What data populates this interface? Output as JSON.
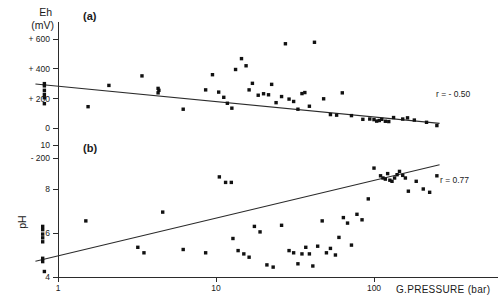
{
  "figure": {
    "background_color": "#ffffff",
    "ink_color": "#1a1a1a",
    "point_color": "#111111"
  },
  "xaxis": {
    "title": "G.PRESSURE (bar)",
    "scale": "log",
    "ticks": [
      "1",
      "10",
      "100"
    ],
    "tick_values": [
      1,
      10,
      100
    ],
    "range": [
      0.7,
      300
    ]
  },
  "panel_a": {
    "label": "(a)",
    "ylabel_line1": "Eh",
    "ylabel_line2": "(mV)",
    "correlation": "r = - 0.50",
    "ticks": [
      "+ 600",
      "+ 400",
      "+ 200",
      "0",
      "- 200"
    ],
    "tick_values": [
      600,
      400,
      200,
      0,
      -200
    ]
  },
  "panel_b": {
    "label": "(b)",
    "ylabel": "pH",
    "correlation": "r = 0.77",
    "ticks": [
      "10",
      "8",
      "6",
      "4"
    ],
    "tick_values": [
      10,
      8,
      6,
      4
    ]
  },
  "chart_data": [
    {
      "type": "scatter",
      "id": "panel-a",
      "title": "(a)",
      "xlabel": "G.PRESSURE (bar)",
      "ylabel": "Eh (mV)",
      "xscale": "log",
      "xlim": [
        0.7,
        300
      ],
      "ylim": [
        -300,
        700
      ],
      "xticks": [
        1,
        10,
        100
      ],
      "yticks": [
        600,
        400,
        200,
        0,
        -200
      ],
      "grid": false,
      "annotation": "r = - 0.50",
      "correlation_r": -0.5,
      "trendline": {
        "x": [
          0.72,
          260
        ],
        "y": [
          297,
          33
        ]
      },
      "points": [
        {
          "x": 0.82,
          "y": 300
        },
        {
          "x": 0.82,
          "y": 285
        },
        {
          "x": 0.82,
          "y": 255
        },
        {
          "x": 0.82,
          "y": 228
        },
        {
          "x": 0.82,
          "y": 205
        },
        {
          "x": 0.82,
          "y": 165
        },
        {
          "x": 1.55,
          "y": 145
        },
        {
          "x": 2.1,
          "y": 288
        },
        {
          "x": 3.4,
          "y": 352
        },
        {
          "x": 4.3,
          "y": 268
        },
        {
          "x": 4.35,
          "y": 255
        },
        {
          "x": 4.3,
          "y": 238
        },
        {
          "x": 6.2,
          "y": 128
        },
        {
          "x": 8.6,
          "y": 258
        },
        {
          "x": 9.5,
          "y": 360
        },
        {
          "x": 10.4,
          "y": 243
        },
        {
          "x": 11.2,
          "y": 208
        },
        {
          "x": 11.8,
          "y": 168
        },
        {
          "x": 12.6,
          "y": 135
        },
        {
          "x": 13.3,
          "y": 395
        },
        {
          "x": 14.5,
          "y": 468
        },
        {
          "x": 15.5,
          "y": 420
        },
        {
          "x": 16.2,
          "y": 258
        },
        {
          "x": 17.0,
          "y": 302
        },
        {
          "x": 18.5,
          "y": 222
        },
        {
          "x": 20.0,
          "y": 232
        },
        {
          "x": 21.5,
          "y": 225
        },
        {
          "x": 22.5,
          "y": 295
        },
        {
          "x": 24.0,
          "y": 172
        },
        {
          "x": 26.0,
          "y": 213
        },
        {
          "x": 27.5,
          "y": 568
        },
        {
          "x": 29.0,
          "y": 196
        },
        {
          "x": 31.0,
          "y": 180
        },
        {
          "x": 33.0,
          "y": 128
        },
        {
          "x": 35.0,
          "y": 233
        },
        {
          "x": 36.5,
          "y": 240
        },
        {
          "x": 39.0,
          "y": 148
        },
        {
          "x": 42.0,
          "y": 578
        },
        {
          "x": 48.0,
          "y": 198
        },
        {
          "x": 53.0,
          "y": 92
        },
        {
          "x": 58.0,
          "y": 88
        },
        {
          "x": 63.0,
          "y": 238
        },
        {
          "x": 72.0,
          "y": 85
        },
        {
          "x": 85.0,
          "y": 60
        },
        {
          "x": 94.0,
          "y": 62
        },
        {
          "x": 100.0,
          "y": 58
        },
        {
          "x": 104.0,
          "y": 48
        },
        {
          "x": 108.0,
          "y": 52
        },
        {
          "x": 112.0,
          "y": 60
        },
        {
          "x": 118.0,
          "y": 47
        },
        {
          "x": 124.0,
          "y": 45
        },
        {
          "x": 133.0,
          "y": 72
        },
        {
          "x": 152.0,
          "y": 62
        },
        {
          "x": 163.0,
          "y": 70
        },
        {
          "x": 180.0,
          "y": 55
        },
        {
          "x": 215.0,
          "y": 40
        },
        {
          "x": 250.0,
          "y": 18
        }
      ]
    },
    {
      "type": "scatter",
      "id": "panel-b",
      "title": "(b)",
      "xlabel": "G.PRESSURE (bar)",
      "ylabel": "pH",
      "xscale": "log",
      "xlim": [
        0.7,
        300
      ],
      "ylim": [
        4,
        10.4
      ],
      "xticks": [
        1,
        10,
        100
      ],
      "yticks": [
        10,
        8,
        6,
        4
      ],
      "grid": false,
      "annotation": "r = 0.77",
      "correlation_r": 0.77,
      "trendline": {
        "x": [
          0.72,
          260
        ],
        "y": [
          4.72,
          9.1
        ]
      },
      "points": [
        {
          "x": 0.8,
          "y": 6.3
        },
        {
          "x": 0.8,
          "y": 6.15
        },
        {
          "x": 0.8,
          "y": 5.95
        },
        {
          "x": 0.8,
          "y": 5.78
        },
        {
          "x": 0.8,
          "y": 5.6
        },
        {
          "x": 0.8,
          "y": 4.85
        },
        {
          "x": 0.8,
          "y": 4.7
        },
        {
          "x": 0.82,
          "y": 4.25
        },
        {
          "x": 1.5,
          "y": 6.55
        },
        {
          "x": 3.2,
          "y": 5.35
        },
        {
          "x": 3.5,
          "y": 5.1
        },
        {
          "x": 4.6,
          "y": 6.95
        },
        {
          "x": 6.2,
          "y": 5.25
        },
        {
          "x": 8.6,
          "y": 5.1
        },
        {
          "x": 10.5,
          "y": 8.55
        },
        {
          "x": 11.5,
          "y": 8.3
        },
        {
          "x": 12.5,
          "y": 8.3
        },
        {
          "x": 12.8,
          "y": 5.75
        },
        {
          "x": 13.8,
          "y": 5.2
        },
        {
          "x": 15.0,
          "y": 5.05
        },
        {
          "x": 16.2,
          "y": 4.9
        },
        {
          "x": 17.5,
          "y": 6.3
        },
        {
          "x": 19.0,
          "y": 6.05
        },
        {
          "x": 21.0,
          "y": 4.55
        },
        {
          "x": 23.0,
          "y": 4.45
        },
        {
          "x": 26.0,
          "y": 6.35
        },
        {
          "x": 29.0,
          "y": 5.2
        },
        {
          "x": 31.0,
          "y": 5.1
        },
        {
          "x": 33.0,
          "y": 4.6
        },
        {
          "x": 35.0,
          "y": 5.05
        },
        {
          "x": 37.0,
          "y": 5.35
        },
        {
          "x": 39.0,
          "y": 5.05
        },
        {
          "x": 41.0,
          "y": 4.5
        },
        {
          "x": 44.0,
          "y": 5.4
        },
        {
          "x": 47.0,
          "y": 6.55
        },
        {
          "x": 50.0,
          "y": 5.1
        },
        {
          "x": 53.0,
          "y": 5.3
        },
        {
          "x": 57.0,
          "y": 5.0
        },
        {
          "x": 60.0,
          "y": 5.8
        },
        {
          "x": 64.0,
          "y": 6.7
        },
        {
          "x": 68.0,
          "y": 6.45
        },
        {
          "x": 72.0,
          "y": 5.45
        },
        {
          "x": 78.0,
          "y": 6.85
        },
        {
          "x": 84.0,
          "y": 6.6
        },
        {
          "x": 92.0,
          "y": 7.55
        },
        {
          "x": 100.0,
          "y": 8.95
        },
        {
          "x": 110.0,
          "y": 8.6
        },
        {
          "x": 114.0,
          "y": 8.5
        },
        {
          "x": 118.0,
          "y": 8.45
        },
        {
          "x": 122.0,
          "y": 8.7
        },
        {
          "x": 126.0,
          "y": 8.4
        },
        {
          "x": 130.0,
          "y": 8.35
        },
        {
          "x": 135.0,
          "y": 8.5
        },
        {
          "x": 140.0,
          "y": 8.65
        },
        {
          "x": 145.0,
          "y": 8.8
        },
        {
          "x": 152.0,
          "y": 8.62
        },
        {
          "x": 158.0,
          "y": 8.5
        },
        {
          "x": 165.0,
          "y": 7.9
        },
        {
          "x": 185.0,
          "y": 8.35
        },
        {
          "x": 205.0,
          "y": 8.0
        },
        {
          "x": 225.0,
          "y": 7.85
        },
        {
          "x": 250.0,
          "y": 8.6
        }
      ]
    }
  ]
}
